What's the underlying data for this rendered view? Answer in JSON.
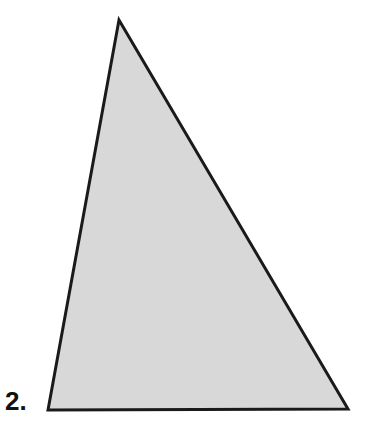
{
  "page": {
    "width": 385,
    "height": 439,
    "background_color": "#FFFFFF",
    "kind": "geometry-figure"
  },
  "problem": {
    "number_label": "2."
  },
  "figure": {
    "name": "triangle",
    "shape_type": "triangle",
    "fill_color": "#D8D8D8",
    "stroke_color": "#1A1A1A",
    "stroke_width": 3,
    "vertices": [
      {
        "name": "apex",
        "x": 119,
        "y": 20
      },
      {
        "name": "bottom-right",
        "x": 348,
        "y": 409
      },
      {
        "name": "bottom-left",
        "x": 48,
        "y": 410
      }
    ],
    "points_attr": "119,20 348,409 48,410",
    "edges": [
      {
        "name": "left-edge",
        "from": "apex",
        "to": "bottom-left"
      },
      {
        "name": "right-edge",
        "from": "apex",
        "to": "bottom-right"
      },
      {
        "name": "base-edge",
        "from": "bottom-left",
        "to": "bottom-right"
      }
    ]
  }
}
